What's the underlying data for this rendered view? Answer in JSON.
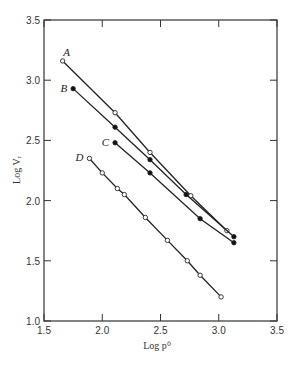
{
  "chart_data": {
    "type": "line",
    "title": "",
    "xlabel": "Log p⁰",
    "ylabel": "Log Vᵣ",
    "xlim": [
      1.5,
      3.5
    ],
    "ylim": [
      1.0,
      3.5
    ],
    "xticks": [
      "1.5",
      "2.0",
      "2.5",
      "3.0",
      "3.5"
    ],
    "yticks": [
      "1.0",
      "1.5",
      "2.0",
      "2.5",
      "3.0",
      "3.5"
    ],
    "grid": false,
    "legend": "inline labels at start of each line",
    "series": [
      {
        "name": "A",
        "marker": "open",
        "x": [
          1.66,
          2.11,
          2.41,
          2.76,
          3.07
        ],
        "y": [
          3.16,
          2.73,
          2.4,
          2.04,
          1.75
        ]
      },
      {
        "name": "B",
        "marker": "filled",
        "x": [
          1.75,
          2.11,
          2.41,
          2.72,
          3.13
        ],
        "y": [
          2.93,
          2.61,
          2.34,
          2.05,
          1.7
        ]
      },
      {
        "name": "C",
        "marker": "filled",
        "x": [
          2.11,
          2.41,
          2.84,
          3.13
        ],
        "y": [
          2.48,
          2.23,
          1.85,
          1.65
        ]
      },
      {
        "name": "D",
        "marker": "open",
        "x": [
          1.89,
          2.0,
          2.13,
          2.19,
          2.37,
          2.56,
          2.73,
          2.84,
          3.02
        ],
        "y": [
          2.35,
          2.23,
          2.1,
          2.05,
          1.86,
          1.67,
          1.5,
          1.38,
          1.2
        ]
      }
    ]
  }
}
